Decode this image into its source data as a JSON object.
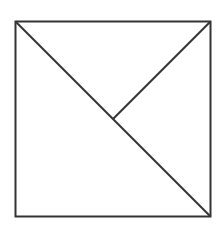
{
  "diagram": {
    "type": "geometric-figure",
    "stroke_color": "#333333",
    "background": "#ffffff",
    "square": {
      "x1": 15,
      "y1": 22,
      "x2": 210,
      "y2": 216
    },
    "diagonal": {
      "from": "top-left",
      "to": "bottom-right"
    },
    "center_segment": {
      "from": "top-right",
      "to": "center"
    }
  }
}
